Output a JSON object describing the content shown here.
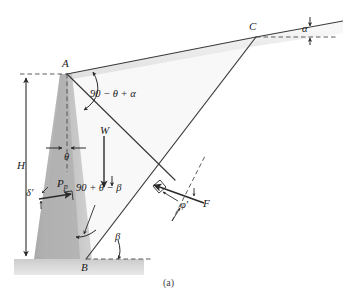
{
  "figure": {
    "caption": "(a)"
  },
  "points": {
    "A": "A",
    "B": "B",
    "C": "C"
  },
  "dimensions": {
    "height_label": "H"
  },
  "angles": {
    "alpha": "α",
    "theta": "θ",
    "beta": "β",
    "delta_prime": "δ′",
    "phi_prime": "φ′",
    "wall_angle_expr": "90 − θ + α",
    "wedge_angle_expr": "90 + θ − β"
  },
  "forces": {
    "weight": "W",
    "passive_pressure": "P",
    "passive_pressure_sub": "p",
    "reaction": "F"
  },
  "colors": {
    "line": "#3a3a3a",
    "wall_fill": "#b8b8b8",
    "soil_fill": "#d8d8d8",
    "ground_fill": "#cfcfcf",
    "text": "#1a1a1a",
    "dashed": "#555555"
  }
}
